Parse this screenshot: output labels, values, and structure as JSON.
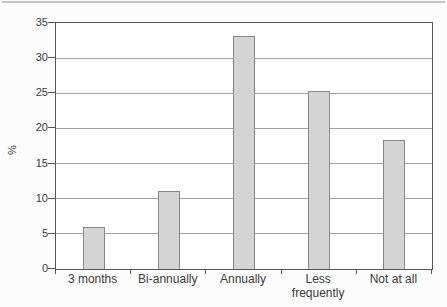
{
  "page": {
    "background": "#fcfcfc",
    "top_rule_color": "#c6c6c6"
  },
  "chart_data": {
    "type": "bar",
    "categories": [
      "3 months",
      "Bi-annually",
      "Annually",
      "Less frequently",
      "Not at all"
    ],
    "values": [
      6,
      11.1,
      33.2,
      25.3,
      18.3
    ],
    "title": "",
    "xlabel": "",
    "ylabel": "%",
    "ylim": [
      0,
      35
    ],
    "yticks": [
      0,
      5,
      10,
      15,
      20,
      25,
      30,
      35
    ],
    "grid": "horizontal",
    "legend": "none",
    "colors": {
      "bar_fill": "#d4d4d4",
      "bar_border": "#878787",
      "gridline": "#a3a3a3",
      "axis": "#565656",
      "text": "#3a3a3a",
      "plot_background": "#ffffff"
    }
  }
}
